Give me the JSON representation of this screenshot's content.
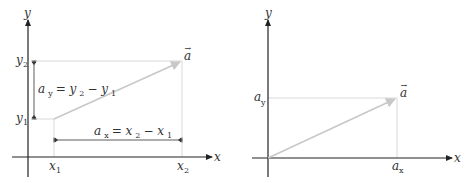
{
  "left_panel": {
    "axis_x_label": "x",
    "axis_y_label": "y",
    "vector_label": "a",
    "vector_arrow": "→",
    "x1_label": "x",
    "x1_sub": "1",
    "x2_label": "x",
    "x2_sub": "2",
    "y1_label": "y",
    "y1_sub": "1",
    "y2_label": "y",
    "y2_sub": "2",
    "ay_eq": {
      "lhs": "a",
      "lhs_sub": "y",
      "eq": " = ",
      "t1": "y",
      "t1_sub": "2",
      "minus": " − ",
      "t2": "y",
      "t2_sub": "1"
    },
    "ax_eq": {
      "lhs": "a",
      "lhs_sub": "x",
      "eq": " = ",
      "t1": "x",
      "t1_sub": "2",
      "minus": " − ",
      "t2": "x",
      "t2_sub": "1"
    }
  },
  "right_panel": {
    "axis_x_label": "x",
    "axis_y_label": "y",
    "vector_label": "a",
    "vector_arrow": "→",
    "ax_label": "a",
    "ax_sub": "x",
    "ay_label": "a",
    "ay_sub": "y"
  },
  "colors": {
    "axis": "#222222",
    "vector": "#c8c8c8",
    "guide": "#cfcfcf",
    "text": "#333333"
  }
}
